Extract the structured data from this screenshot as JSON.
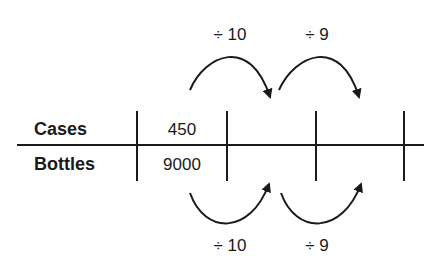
{
  "table": {
    "rows": [
      {
        "label": "Cases",
        "values": [
          "450",
          "",
          "",
          ""
        ]
      },
      {
        "label": "Bottles",
        "values": [
          "9000",
          "",
          "",
          ""
        ]
      }
    ]
  },
  "operations": {
    "top": [
      {
        "label": "÷ 10",
        "from_column": 1,
        "to_column": 2
      },
      {
        "label": "÷ 9",
        "from_column": 2,
        "to_column": 3
      }
    ],
    "bottom": [
      {
        "label": "÷ 10",
        "from_column": 1,
        "to_column": 2
      },
      {
        "label": "÷ 9",
        "from_column": 2,
        "to_column": 3
      }
    ]
  },
  "colors": {
    "ink": "#1a1a1a",
    "background": "#ffffff"
  }
}
